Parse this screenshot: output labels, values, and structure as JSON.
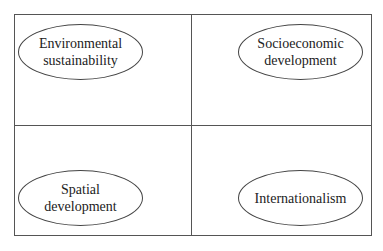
{
  "diagram": {
    "quadrants": [
      {
        "position": "top-left",
        "label": "Environmental\nsustainability"
      },
      {
        "position": "top-right",
        "label": "Socioeconomic\ndevelopment"
      },
      {
        "position": "bottom-left",
        "label": "Spatial\ndevelopment"
      },
      {
        "position": "bottom-right",
        "label": "Internationalism"
      }
    ],
    "colors": {
      "border": "#555555",
      "background": "#ffffff",
      "text": "#222222"
    }
  }
}
